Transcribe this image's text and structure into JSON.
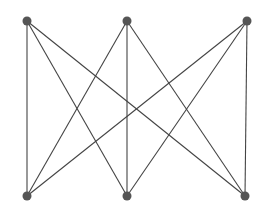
{
  "graph": {
    "type": "complete-bipartite-K3,3",
    "edge_color": "#444444",
    "node_color": "#555555",
    "node_radius": 4.5,
    "nodes": [
      {
        "id": "t1",
        "x": 27,
        "y": 21
      },
      {
        "id": "t2",
        "x": 127,
        "y": 21
      },
      {
        "id": "t3",
        "x": 247,
        "y": 21
      },
      {
        "id": "b1",
        "x": 27,
        "y": 196
      },
      {
        "id": "b2",
        "x": 127,
        "y": 196
      },
      {
        "id": "b3",
        "x": 245,
        "y": 196
      }
    ],
    "edges": [
      [
        "t1",
        "b1"
      ],
      [
        "t1",
        "b2"
      ],
      [
        "t1",
        "b3"
      ],
      [
        "t2",
        "b1"
      ],
      [
        "t2",
        "b2"
      ],
      [
        "t2",
        "b3"
      ],
      [
        "t3",
        "b1"
      ],
      [
        "t3",
        "b2"
      ],
      [
        "t3",
        "b3"
      ]
    ]
  }
}
